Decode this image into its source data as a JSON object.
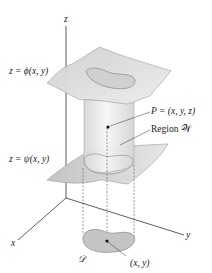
{
  "labels": {
    "z_axis": "z",
    "x_axis": "x",
    "y_axis": "y",
    "top_surface": "z = ϕ(x, y)",
    "bottom_surface": "z = ψ(x, y)",
    "point": "P = (x, y, z)",
    "region": "Region 𝒲",
    "domain": "𝒟",
    "projection_point": "(x, y)"
  },
  "colors": {
    "surface_fill": "#dcdcdc",
    "surface_edge": "#8a8a8a",
    "cylinder_fill": "#ececec",
    "domain_fill": "#c8c8c8",
    "axis": "#333333"
  }
}
